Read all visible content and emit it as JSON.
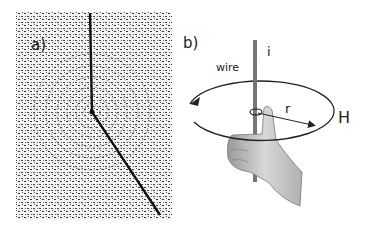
{
  "figure": {
    "panel_a": {
      "label": "a)",
      "description": "Iron filings arranged in concentric circles around a current-carrying wire"
    },
    "panel_b": {
      "label": "b)",
      "wire_label": "wire",
      "current_label": "i",
      "radius_label": "r",
      "field_label": "H",
      "description": "Right-hand rule: thumb along current i, fingers curl in direction of magnetic field H"
    },
    "colors": {
      "ink": "#222222",
      "wire": "#777777",
      "hand": "#bdbdbd",
      "filings": "#333333"
    }
  }
}
